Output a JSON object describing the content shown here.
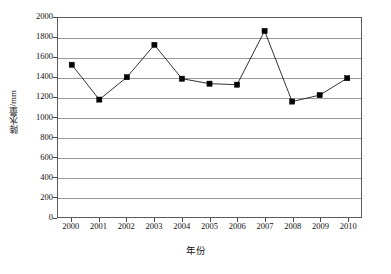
{
  "chart_data": {
    "type": "line",
    "title": "",
    "subtitle": "",
    "xlabel": "年份",
    "ylabel": "降水量/mm",
    "categories": [
      "2000",
      "2001",
      "2002",
      "2003",
      "2004",
      "2005",
      "2006",
      "2007",
      "2008",
      "2009",
      "2010"
    ],
    "values": [
      1530,
      1180,
      1405,
      1730,
      1390,
      1340,
      1330,
      1870,
      1160,
      1225,
      1395
    ],
    "series": [
      {
        "name": "降水量",
        "values": [
          1530,
          1180,
          1405,
          1730,
          1390,
          1340,
          1330,
          1870,
          1160,
          1225,
          1395
        ]
      }
    ],
    "ylim": [
      0,
      2000
    ],
    "y_ticks": [
      "0",
      "200",
      "400",
      "600",
      "800",
      "1000",
      "1200",
      "1400",
      "1600",
      "1800",
      "2000"
    ],
    "y_tick_values": [
      0,
      200,
      400,
      600,
      800,
      1000,
      1200,
      1400,
      1600,
      1800,
      2000
    ],
    "x_ticks": [
      "2000",
      "2001",
      "2002",
      "2003",
      "2004",
      "2005",
      "2006",
      "2007",
      "2008",
      "2009",
      "2010"
    ],
    "grid": "horizontal",
    "legend": "none",
    "marker": "square",
    "colors": {
      "line": "#1a1a1a",
      "marker": "#000000",
      "gridline": "#9a9a9a",
      "frame": "#5a5a5a",
      "background": "#ffffff",
      "text": "#111111"
    }
  }
}
